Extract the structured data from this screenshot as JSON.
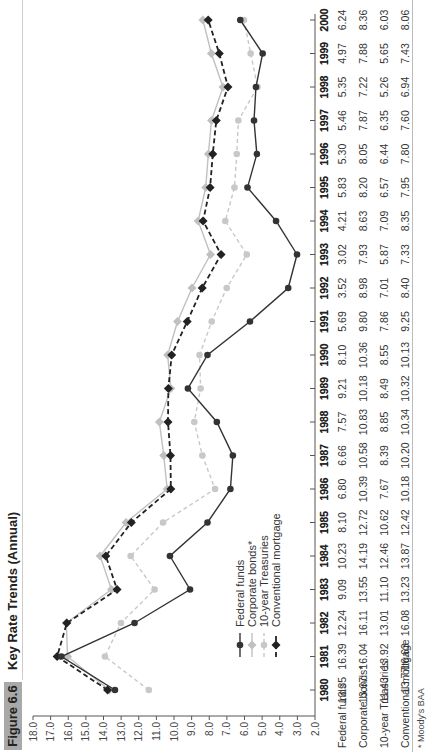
{
  "figure": {
    "label": "Figure 6.6",
    "title": "Key Rate Trends (Annual)"
  },
  "footnote": "* Moody's BAA",
  "chart_data": {
    "type": "line",
    "title": "Key Rate Trends (Annual)",
    "xlabel": "",
    "ylabel": "",
    "x": [
      1980,
      1981,
      1982,
      1983,
      1984,
      1985,
      1986,
      1987,
      1988,
      1989,
      1990,
      1991,
      1992,
      1993,
      1994,
      1995,
      1996,
      1997,
      1998,
      1999,
      2000
    ],
    "ylim": [
      2.0,
      18.0
    ],
    "yticks": [
      "18.0",
      "17.0",
      "16.0",
      "15.0",
      "14.0",
      "13.0",
      "12.0",
      "11.0",
      "10.0",
      "9.0",
      "8.0",
      "7.0",
      "6.0",
      "5.0",
      "4.0",
      "3.0",
      "2.0"
    ],
    "grid": false,
    "legend_position": "lower left (inside plot)",
    "orientation": "rotated 90 degrees counter-clockwise",
    "series": [
      {
        "name": "Federal funds",
        "style": "solid black, circle markers",
        "color": "#333333",
        "values": [
          13.35,
          16.39,
          12.24,
          9.09,
          10.23,
          8.1,
          6.8,
          6.66,
          7.57,
          9.21,
          8.1,
          5.69,
          3.52,
          3.02,
          4.21,
          5.83,
          5.3,
          5.46,
          5.35,
          4.97,
          6.24
        ]
      },
      {
        "name": "Corporate bonds*",
        "style": "solid light gray, diamond markers",
        "color": "#c0c0c0",
        "values": [
          13.67,
          16.04,
          16.11,
          13.55,
          14.19,
          12.72,
          10.39,
          10.58,
          10.83,
          10.18,
          10.36,
          9.8,
          8.98,
          7.93,
          8.63,
          8.2,
          8.05,
          7.87,
          7.22,
          7.88,
          8.36
        ]
      },
      {
        "name": "10-year Treasuries",
        "style": "dashed light gray, circle markers",
        "color": "#c8c8c8",
        "values": [
          11.43,
          13.92,
          13.01,
          11.1,
          12.46,
          10.62,
          7.67,
          8.39,
          8.85,
          8.49,
          8.55,
          7.86,
          7.01,
          5.87,
          7.09,
          6.57,
          6.44,
          6.35,
          5.26,
          5.65,
          6.03
        ]
      },
      {
        "name": "Conventional mortgage",
        "style": "dashed black, diamond markers",
        "color": "#222222",
        "values": [
          13.77,
          16.63,
          16.08,
          13.23,
          13.87,
          12.42,
          10.18,
          10.2,
          10.34,
          10.32,
          10.13,
          9.25,
          8.4,
          7.33,
          8.35,
          7.95,
          7.8,
          7.6,
          6.94,
          7.43,
          8.06
        ]
      }
    ]
  },
  "table": {
    "years": [
      "1980",
      "1981",
      "1982",
      "1983",
      "1984",
      "1985",
      "1986",
      "1987",
      "1988",
      "1989",
      "1990",
      "1991",
      "1992",
      "1993",
      "1994",
      "1995",
      "1996",
      "1997",
      "1998",
      "1999",
      "2000"
    ],
    "rows": [
      {
        "label": "Federal funds",
        "values": [
          "13.35",
          "16.39",
          "12.24",
          "9.09",
          "10.23",
          "8.10",
          "6.80",
          "6.66",
          "7.57",
          "9.21",
          "8.10",
          "5.69",
          "3.52",
          "3.02",
          "4.21",
          "5.83",
          "5.30",
          "5.46",
          "5.35",
          "4.97",
          "6.24"
        ]
      },
      {
        "label": "Corporate bonds*",
        "values": [
          "13.67",
          "16.04",
          "16.11",
          "13.55",
          "14.19",
          "12.72",
          "10.39",
          "10.58",
          "10.83",
          "10.18",
          "10.36",
          "9.80",
          "8.98",
          "7.93",
          "8.63",
          "8.20",
          "8.05",
          "7.87",
          "7.22",
          "7.88",
          "8.36"
        ]
      },
      {
        "label": "10-year Treasuries",
        "values": [
          "11.43",
          "13.92",
          "13.01",
          "11.10",
          "12.46",
          "10.62",
          "7.67",
          "8.39",
          "8.85",
          "8.49",
          "8.55",
          "7.86",
          "7.01",
          "5.87",
          "7.09",
          "6.57",
          "6.44",
          "6.35",
          "5.26",
          "5.65",
          "6.03"
        ]
      },
      {
        "label": "Conventional mortgage",
        "values": [
          "13.77",
          "16.63",
          "16.08",
          "13.23",
          "13.87",
          "12.42",
          "10.18",
          "10.20",
          "10.34",
          "10.32",
          "10.13",
          "9.25",
          "8.40",
          "7.33",
          "8.35",
          "7.95",
          "7.80",
          "7.60",
          "6.94",
          "7.43",
          "8.06"
        ]
      }
    ]
  }
}
